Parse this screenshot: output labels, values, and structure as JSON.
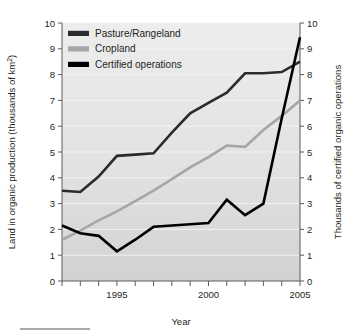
{
  "chart_data": {
    "type": "line",
    "title": "",
    "xlabel": "Year",
    "ylabel": "Land in organic production (thousands of km2)",
    "ylabel_display": "Land in organic production (thousands of km",
    "ylabel_superscript": "2",
    "ylabel_tail": ")",
    "y2label": "Thousands of certified organic operations",
    "xlim": [
      1992,
      2005
    ],
    "ylim": [
      0,
      10
    ],
    "y2lim": [
      0,
      10
    ],
    "grid": true,
    "legend_position": "top-left",
    "x_tick_values": [
      1992,
      1993,
      1994,
      1995,
      1996,
      1997,
      1998,
      1999,
      2000,
      2001,
      2002,
      2003,
      2004,
      2005
    ],
    "x_tick_labels": [
      "",
      "",
      "",
      "1995",
      "",
      "",
      "",
      "",
      "2000",
      "",
      "",
      "",
      "",
      "2005"
    ],
    "y_tick_values": [
      0,
      1,
      2,
      3,
      4,
      5,
      6,
      7,
      8,
      9,
      10
    ],
    "y_tick_labels": [
      "0",
      "1",
      "2",
      "3",
      "4",
      "5",
      "6",
      "7",
      "8",
      "9",
      "10"
    ],
    "y2_tick_values": [
      0,
      1,
      2,
      3,
      4,
      5,
      6,
      7,
      8,
      9,
      10
    ],
    "y2_tick_labels": [
      "0",
      "1",
      "2",
      "3",
      "4",
      "5",
      "6",
      "7",
      "8",
      "9",
      "10"
    ],
    "x": [
      1992,
      1993,
      1994,
      1995,
      1996,
      1997,
      1998,
      1999,
      2000,
      2001,
      2002,
      2003,
      2004,
      2005
    ],
    "series": [
      {
        "name": "Pasture/Rangeland",
        "axis": "left",
        "color": "#2b2b2b",
        "width": 2.6,
        "values": [
          3.5,
          3.45,
          4.05,
          4.85,
          4.9,
          4.95,
          5.75,
          6.5,
          6.9,
          7.3,
          8.05,
          8.05,
          8.1,
          8.5
        ]
      },
      {
        "name": "Cropland",
        "axis": "left",
        "color": "#a6a6a6",
        "width": 2.6,
        "values": [
          1.6,
          1.95,
          2.35,
          2.7,
          3.1,
          3.5,
          3.95,
          4.4,
          4.8,
          5.25,
          5.2,
          5.85,
          6.4,
          7.0
        ]
      },
      {
        "name": "Certified operations",
        "axis": "right",
        "color": "#000000",
        "width": 2.6,
        "values": [
          2.15,
          1.85,
          1.75,
          1.15,
          1.6,
          2.1,
          2.15,
          2.2,
          2.25,
          3.15,
          2.55,
          3.0,
          6.3,
          9.45
        ]
      }
    ],
    "legend": [
      {
        "label": "Pasture/Rangeland",
        "color": "#2b2b2b"
      },
      {
        "label": "Cropland",
        "color": "#a6a6a6"
      },
      {
        "label": "Certified operations",
        "color": "#000000"
      }
    ],
    "plot_bg_top": "#ececec",
    "plot_bg_bottom": "#d3d3d3"
  }
}
